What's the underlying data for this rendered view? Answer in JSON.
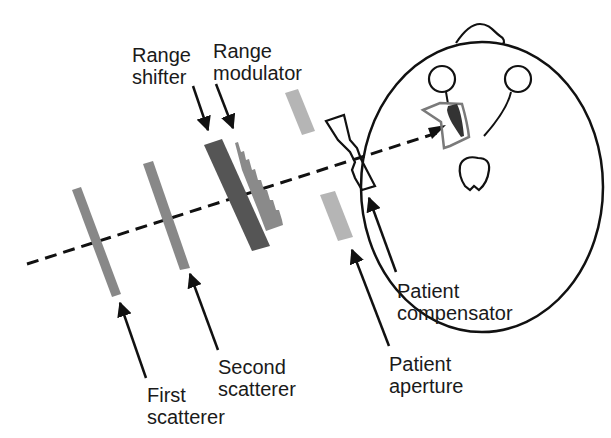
{
  "diagram": {
    "colors": {
      "line": "#111111",
      "scatterer": "#888888",
      "range_shifter": "#555555",
      "range_modulator": "#8a8a8a",
      "aperture": "#b5b5b5",
      "target_outline": "#7a7a7a",
      "target_fill": "#333333"
    },
    "labels": {
      "range_shifter": {
        "line1": "Range",
        "line2": "shifter"
      },
      "range_modulator": {
        "line1": "Range",
        "line2": "modulator"
      },
      "first_scatterer": {
        "line1": "First",
        "line2": "scatterer"
      },
      "second_scatterer": {
        "line1": "Second",
        "line2": "scatterer"
      },
      "patient_compensator": {
        "line1": "Patient",
        "line2": "compensator"
      },
      "patient_aperture": {
        "line1": "Patient",
        "line2": "aperture"
      }
    }
  }
}
